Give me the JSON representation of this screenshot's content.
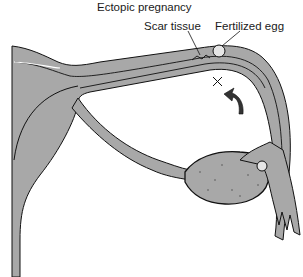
{
  "diagram": {
    "title": "Ectopic pregnancy",
    "labels": {
      "title": "Ectopic pregnancy",
      "scar_tissue": "Scar tissue",
      "fertilized_egg": "Fertilized egg"
    },
    "markers": {
      "x_mark": "+",
      "arrow": "curved-arrow"
    },
    "colors": {
      "tissue_fill": "#a8a8a8",
      "outline": "#111111",
      "background": "#ffffff",
      "egg_fill": "#e6e6e6"
    }
  }
}
